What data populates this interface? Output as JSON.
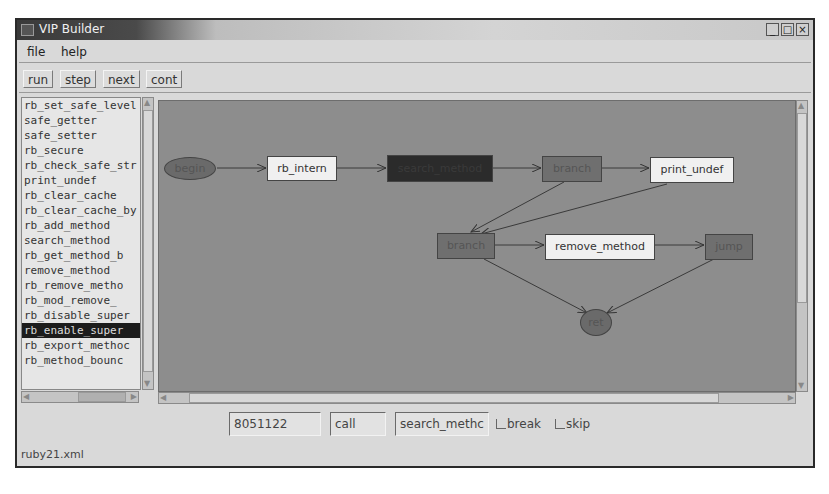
{
  "window": {
    "title": "VIP Builder",
    "controls": {
      "minimize": "_",
      "maximize": "□",
      "close": "×"
    }
  },
  "menu": [
    {
      "label": "file"
    },
    {
      "label": "help"
    }
  ],
  "toolbar": {
    "buttons": [
      {
        "label": "run"
      },
      {
        "label": "step"
      },
      {
        "label": "next"
      },
      {
        "label": "cont"
      }
    ]
  },
  "function_list": {
    "items": [
      "rb_set_safe_level",
      "safe_getter",
      "safe_setter",
      "rb_secure",
      "rb_check_safe_str",
      "print_undef",
      "rb_clear_cache",
      "rb_clear_cache_by",
      "rb_add_method",
      "search_method",
      "rb_get_method_b",
      "remove_method",
      "rb_remove_metho",
      "rb_mod_remove_",
      "rb_disable_super",
      "rb_enable_super",
      "rb_export_methoc",
      "rb_method_bounc"
    ],
    "selected_index": 15
  },
  "graph": {
    "nodes": [
      {
        "id": "begin",
        "label": "begin",
        "shape": "ellipse"
      },
      {
        "id": "rb_intern",
        "label": "rb_intern",
        "shape": "box",
        "style": "light"
      },
      {
        "id": "search_method",
        "label": "search_method",
        "shape": "box",
        "style": "dark"
      },
      {
        "id": "branch1",
        "label": "branch",
        "shape": "box",
        "style": "mid"
      },
      {
        "id": "print_undef",
        "label": "print_undef",
        "shape": "box",
        "style": "light"
      },
      {
        "id": "branch2",
        "label": "branch",
        "shape": "box",
        "style": "mid"
      },
      {
        "id": "remove_method",
        "label": "remove_method",
        "shape": "box",
        "style": "light"
      },
      {
        "id": "jump",
        "label": "jump",
        "shape": "box",
        "style": "mid"
      },
      {
        "id": "ret",
        "label": "ret",
        "shape": "ellipse"
      }
    ],
    "edges": [
      [
        "begin",
        "rb_intern"
      ],
      [
        "rb_intern",
        "search_method"
      ],
      [
        "search_method",
        "branch1"
      ],
      [
        "branch1",
        "print_undef"
      ],
      [
        "branch1",
        "branch2"
      ],
      [
        "print_undef",
        "branch2"
      ],
      [
        "branch2",
        "remove_method"
      ],
      [
        "branch2",
        "ret"
      ],
      [
        "remove_method",
        "jump"
      ],
      [
        "jump",
        "ret"
      ]
    ]
  },
  "bottom_bar": {
    "address": "8051122",
    "type": "call",
    "function": "search_methc",
    "break_label": "break",
    "skip_label": "skip",
    "break_checked": false,
    "skip_checked": false
  },
  "status": {
    "file": "ruby21.xml"
  }
}
